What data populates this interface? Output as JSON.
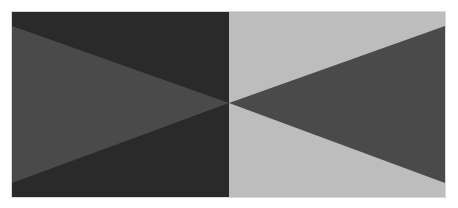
{
  "figure": {
    "canvas": {
      "width": 458,
      "height": 208,
      "background": "#ffffff"
    },
    "frame": {
      "x1": 12,
      "y1": 12,
      "x2": 445,
      "y2": 197,
      "split_x": 229,
      "center_y": 103
    },
    "colors": {
      "left_field": "#2a2a2a",
      "right_field": "#bdbdbd",
      "triangle": "#4a4a4a",
      "border": "#d8d8d8"
    },
    "left_triangle": {
      "points": "12,26 229,103 12,183"
    },
    "right_triangle": {
      "points": "445,26 229,103 445,183"
    },
    "left_field_rect": {
      "x": 12,
      "y": 12,
      "width": 217,
      "height": 185
    },
    "right_field_rect": {
      "x": 229,
      "y": 12,
      "width": 216,
      "height": 185
    }
  }
}
